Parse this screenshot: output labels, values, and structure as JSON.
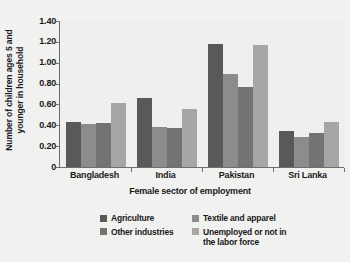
{
  "chart_data": {
    "type": "bar",
    "title": "",
    "subtitle": "",
    "xlabel": "Female sector of employment",
    "ylabel": "Number of children ages 5 and younger in household",
    "ylabel_line1": "Number of children ages 5 and",
    "ylabel_line2": "younger in household",
    "categories": [
      "Bangladesh",
      "India",
      "Pakistan",
      "Sri Lanka"
    ],
    "series": [
      {
        "name": "Agriculture",
        "color": "#595959",
        "values": [
          0.43,
          0.66,
          1.18,
          0.35
        ]
      },
      {
        "name": "Textile and apparel",
        "color": "#8c8c8c",
        "values": [
          0.41,
          0.38,
          0.89,
          0.29
        ]
      },
      {
        "name": "Other industries",
        "color": "#737373",
        "values": [
          0.42,
          0.37,
          0.77,
          0.33
        ]
      },
      {
        "name": "Unemployed or not in\nthe labor force",
        "color": "#a6a6a6",
        "values": [
          0.61,
          0.56,
          1.17,
          0.43
        ]
      }
    ],
    "ylim": [
      0,
      1.4
    ],
    "ytick_values": [
      0,
      0.2,
      0.4,
      0.6,
      0.8,
      1.0,
      1.2,
      1.4
    ],
    "ytick_labels": [
      "0",
      "0.20",
      "0.40",
      "0.60",
      "0.80",
      "1.00",
      "1.20",
      "1.40"
    ],
    "grid": false,
    "legend_position": "bottom",
    "plot_background": "#efefee",
    "axis_color": "#6e6e6e"
  }
}
